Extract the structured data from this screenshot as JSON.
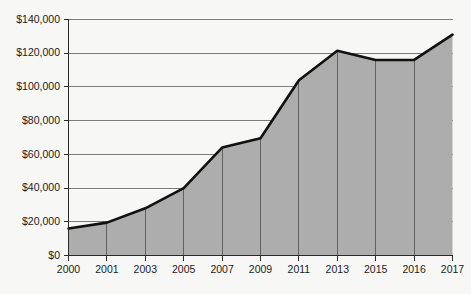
{
  "chart_data": {
    "type": "area",
    "title": "",
    "subtitle": "",
    "xlabel": "",
    "ylabel": "",
    "categories": [
      "2000",
      "2001",
      "2003",
      "2005",
      "2007",
      "2009",
      "2011",
      "2013",
      "2015",
      "2016",
      "2017"
    ],
    "values": [
      16000,
      19500,
      28000,
      40000,
      64000,
      69500,
      104000,
      121500,
      116000,
      116000,
      131000
    ],
    "series": [
      {
        "name": "",
        "values": [
          16000,
          19500,
          28000,
          40000,
          64000,
          69500,
          104000,
          121500,
          116000,
          116000,
          131000
        ]
      }
    ],
    "ylim": [
      0,
      140000
    ],
    "yticks": [
      0,
      20000,
      40000,
      60000,
      80000,
      100000,
      120000,
      140000
    ],
    "ytick_labels": [
      "$0",
      "$20,000",
      "$40,000",
      "$60,000",
      "$80,000",
      "$100,000",
      "$120,000",
      "$140,000"
    ],
    "xtick_labels": [
      "2000",
      "2001",
      "2003",
      "2005",
      "2007",
      "2009",
      "2011",
      "2013",
      "2015",
      "2016",
      "2017"
    ],
    "grid": "horizontal",
    "legend": "none",
    "colors": {
      "area_fill": "#adadad",
      "line": "#111111",
      "gridline": "#6e6e6e",
      "axis": "#2a2a2a",
      "dropline": "#5a5a5a",
      "background": "#f7f7f5",
      "text": "#1b1b1b"
    }
  },
  "axes": {
    "y_labels": [
      "$140,000",
      "$120,000",
      "$100,000",
      "$80,000",
      "$60,000",
      "$40,000",
      "$20,000",
      "$0"
    ],
    "x_labels": [
      "2000",
      "2001",
      "2003",
      "2005",
      "2007",
      "2009",
      "2011",
      "2013",
      "2015",
      "2016",
      "2017"
    ]
  }
}
